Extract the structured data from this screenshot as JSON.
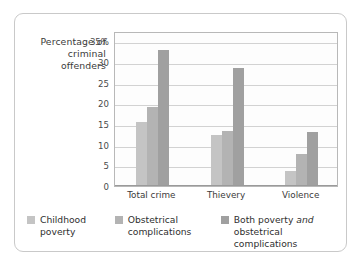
{
  "figure": {
    "axis_title": "Percentage\nof criminal\noffenders"
  },
  "legend": {
    "items": [
      {
        "label": "Childhood\npoverty",
        "color": "#c4c4c4"
      },
      {
        "label": "Obstetrical\ncomplications",
        "color": "#b3b3b3"
      },
      {
        "label_html": "Both poverty <i>and</i>\nobstetrical complications",
        "color": "#a0a0a0"
      }
    ]
  },
  "chart_data": {
    "type": "bar",
    "title": "",
    "xlabel": "",
    "ylabel": "Percentage of criminal offenders",
    "categories": [
      "Total crime",
      "Thievery",
      "Violence"
    ],
    "series": [
      {
        "name": "Childhood poverty",
        "values": [
          15.5,
          12.3,
          3.7
        ],
        "color": "#c4c4c4"
      },
      {
        "name": "Obstetrical complications",
        "values": [
          19.0,
          13.4,
          7.7
        ],
        "color": "#b3b3b3"
      },
      {
        "name": "Both poverty and obstetrical complications",
        "values": [
          33.0,
          28.5,
          13.0
        ],
        "color": "#a0a0a0"
      }
    ],
    "ylim": [
      0,
      37.5
    ],
    "yticks": [
      0,
      5,
      10,
      15,
      20,
      25,
      30,
      35
    ],
    "ytick_labels": [
      "0",
      "5",
      "10",
      "15",
      "20",
      "25",
      "30",
      "35%"
    ],
    "grid": true,
    "legend_position": "bottom"
  }
}
